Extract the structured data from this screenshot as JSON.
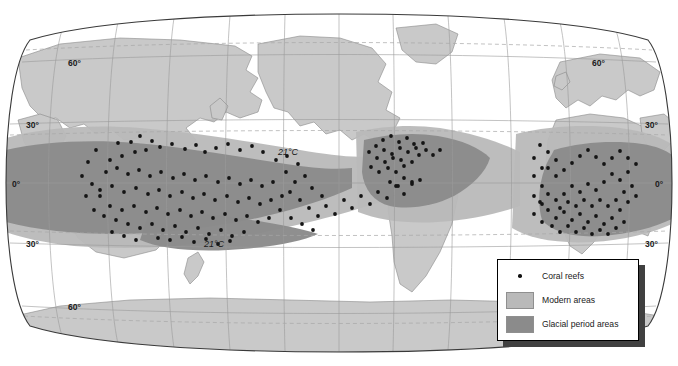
{
  "figure": {
    "kind": "world-map",
    "projection": "robinson-like",
    "title": "",
    "background_color": "#ffffff"
  },
  "colors": {
    "ocean": "#ffffff",
    "land": "#c9c9c9",
    "land_outline": "#8a8a8a",
    "modern_areas": "#b9b9b9",
    "glacial_period_areas": "#8b8b8b",
    "graticule": "#9a9a9a",
    "tropic_dashed": "#a8a8a8",
    "map_border": "#3a3a3a",
    "reef_dot": "#141414",
    "legend_border": "#000000",
    "legend_shadow": "#404040",
    "text": "#1a1a1a"
  },
  "graticule": {
    "latitude_lines": [
      60,
      30,
      0,
      -30,
      -60
    ],
    "longitude_step_deg": 30,
    "dashed_latitudes": [
      66.5,
      23.5,
      -23.5,
      -66.5
    ]
  },
  "latitude_labels": {
    "left": [
      {
        "text": "60°",
        "lat": 60
      },
      {
        "text": "30°",
        "lat": 30
      },
      {
        "text": "0°",
        "lat": 0
      },
      {
        "text": "30°",
        "lat": -30
      },
      {
        "text": "60°",
        "lat": -60
      }
    ],
    "right": [
      {
        "text": "60°",
        "lat": 60
      },
      {
        "text": "30°",
        "lat": 30
      },
      {
        "text": "0°",
        "lat": 0
      },
      {
        "text": "30°",
        "lat": -30
      }
    ]
  },
  "isotherms": [
    {
      "label": "21°C",
      "hemisphere": "north",
      "x": 296,
      "y": 151
    },
    {
      "label": "21°C",
      "hemisphere": "south",
      "x": 222,
      "y": 243
    }
  ],
  "legend": {
    "items": [
      {
        "key": "point",
        "label": "Coral reefs",
        "color": "#141414"
      },
      {
        "key": "swatch",
        "label": "Modern areas",
        "color": "#b9b9b9"
      },
      {
        "key": "swatch",
        "label": "Glacial period areas",
        "color": "#8b8b8b"
      }
    ]
  },
  "chart_data": {
    "type": "map",
    "xlabel": "Longitude",
    "ylabel": "Latitude",
    "xlim": [
      -180,
      180
    ],
    "ylim": [
      -90,
      90
    ],
    "grid": true,
    "legend_position": "bottom-right",
    "series": [
      {
        "name": "Coral reefs",
        "kind": "points",
        "color": "#141414"
      },
      {
        "name": "Modern areas",
        "kind": "region",
        "color": "#b9b9b9"
      },
      {
        "name": "Glacial period areas",
        "kind": "region",
        "color": "#8b8b8b"
      }
    ],
    "annotations": [
      "21°C",
      "21°C"
    ],
    "reef_points": [
      [
        118,
        143
      ],
      [
        131,
        142
      ],
      [
        140,
        136
      ],
      [
        152,
        141
      ],
      [
        110,
        160
      ],
      [
        122,
        156
      ],
      [
        135,
        152
      ],
      [
        146,
        150
      ],
      [
        160,
        147
      ],
      [
        172,
        144
      ],
      [
        185,
        149
      ],
      [
        196,
        145
      ],
      [
        205,
        152
      ],
      [
        216,
        148
      ],
      [
        228,
        144
      ],
      [
        240,
        150
      ],
      [
        252,
        146
      ],
      [
        263,
        152
      ],
      [
        106,
        172
      ],
      [
        117,
        168
      ],
      [
        128,
        174
      ],
      [
        139,
        170
      ],
      [
        150,
        176
      ],
      [
        161,
        172
      ],
      [
        173,
        178
      ],
      [
        184,
        174
      ],
      [
        195,
        180
      ],
      [
        206,
        176
      ],
      [
        218,
        182
      ],
      [
        229,
        178
      ],
      [
        240,
        184
      ],
      [
        251,
        180
      ],
      [
        262,
        186
      ],
      [
        273,
        182
      ],
      [
        100,
        190
      ],
      [
        112,
        186
      ],
      [
        124,
        192
      ],
      [
        136,
        188
      ],
      [
        148,
        194
      ],
      [
        159,
        190
      ],
      [
        170,
        196
      ],
      [
        182,
        192
      ],
      [
        193,
        198
      ],
      [
        204,
        194
      ],
      [
        215,
        200
      ],
      [
        227,
        196
      ],
      [
        238,
        202
      ],
      [
        249,
        198
      ],
      [
        260,
        204
      ],
      [
        271,
        200
      ],
      [
        282,
        196
      ],
      [
        110,
        206
      ],
      [
        122,
        210
      ],
      [
        134,
        206
      ],
      [
        146,
        212
      ],
      [
        157,
        208
      ],
      [
        168,
        214
      ],
      [
        180,
        210
      ],
      [
        191,
        216
      ],
      [
        202,
        212
      ],
      [
        213,
        218
      ],
      [
        225,
        214
      ],
      [
        236,
        220
      ],
      [
        247,
        216
      ],
      [
        258,
        222
      ],
      [
        269,
        218
      ],
      [
        128,
        224
      ],
      [
        140,
        228
      ],
      [
        152,
        224
      ],
      [
        163,
        230
      ],
      [
        175,
        226
      ],
      [
        186,
        232
      ],
      [
        198,
        228
      ],
      [
        209,
        234
      ],
      [
        221,
        230
      ],
      [
        232,
        236
      ],
      [
        244,
        232
      ],
      [
        158,
        238
      ],
      [
        170,
        240
      ],
      [
        182,
        237
      ],
      [
        194,
        242
      ],
      [
        206,
        239
      ],
      [
        218,
        244
      ],
      [
        230,
        241
      ],
      [
        96,
        150
      ],
      [
        88,
        162
      ],
      [
        82,
        176
      ],
      [
        92,
        184
      ],
      [
        100,
        196
      ],
      [
        86,
        196
      ],
      [
        94,
        210
      ],
      [
        104,
        216
      ],
      [
        116,
        220
      ],
      [
        112,
        232
      ],
      [
        124,
        236
      ],
      [
        136,
        240
      ],
      [
        276,
        160
      ],
      [
        287,
        156
      ],
      [
        298,
        164
      ],
      [
        286,
        172
      ],
      [
        295,
        182
      ],
      [
        305,
        176
      ],
      [
        290,
        192
      ],
      [
        300,
        200
      ],
      [
        312,
        188
      ],
      [
        322,
        196
      ],
      [
        309,
        208
      ],
      [
        318,
        216
      ],
      [
        280,
        210
      ],
      [
        291,
        218
      ],
      [
        302,
        224
      ],
      [
        313,
        230
      ],
      [
        326,
        206
      ],
      [
        335,
        214
      ],
      [
        344,
        200
      ],
      [
        352,
        208
      ],
      [
        361,
        196
      ],
      [
        370,
        204
      ],
      [
        378,
        192
      ],
      [
        387,
        198
      ],
      [
        396,
        186
      ],
      [
        404,
        194
      ],
      [
        412,
        182
      ],
      [
        383,
        140
      ],
      [
        391,
        136
      ],
      [
        399,
        142
      ],
      [
        407,
        138
      ],
      [
        414,
        144
      ],
      [
        376,
        146
      ],
      [
        384,
        150
      ],
      [
        392,
        154
      ],
      [
        400,
        148
      ],
      [
        408,
        152
      ],
      [
        416,
        148
      ],
      [
        423,
        143
      ],
      [
        369,
        152
      ],
      [
        377,
        158
      ],
      [
        385,
        162
      ],
      [
        393,
        158
      ],
      [
        401,
        160
      ],
      [
        388,
        168
      ],
      [
        396,
        172
      ],
      [
        404,
        166
      ],
      [
        412,
        162
      ],
      [
        371,
        167
      ],
      [
        379,
        172
      ],
      [
        419,
        155
      ],
      [
        426,
        150
      ],
      [
        433,
        155
      ],
      [
        440,
        150
      ],
      [
        404,
        178
      ],
      [
        412,
        184
      ],
      [
        420,
        180
      ],
      [
        398,
        186
      ],
      [
        390,
        182
      ],
      [
        540,
        145
      ],
      [
        548,
        152
      ],
      [
        556,
        160
      ],
      [
        548,
        168
      ],
      [
        556,
        176
      ],
      [
        564,
        170
      ],
      [
        572,
        163
      ],
      [
        580,
        156
      ],
      [
        588,
        150
      ],
      [
        596,
        157
      ],
      [
        604,
        164
      ],
      [
        612,
        158
      ],
      [
        620,
        151
      ],
      [
        628,
        158
      ],
      [
        636,
        164
      ],
      [
        628,
        172
      ],
      [
        620,
        180
      ],
      [
        612,
        174
      ],
      [
        604,
        182
      ],
      [
        596,
        190
      ],
      [
        588,
        184
      ],
      [
        580,
        192
      ],
      [
        572,
        186
      ],
      [
        564,
        194
      ],
      [
        556,
        200
      ],
      [
        548,
        194
      ],
      [
        540,
        202
      ],
      [
        548,
        210
      ],
      [
        556,
        218
      ],
      [
        564,
        212
      ],
      [
        572,
        220
      ],
      [
        580,
        214
      ],
      [
        588,
        222
      ],
      [
        596,
        216
      ],
      [
        604,
        224
      ],
      [
        612,
        218
      ],
      [
        620,
        210
      ],
      [
        628,
        202
      ],
      [
        636,
        196
      ],
      [
        632,
        186
      ],
      [
        624,
        192
      ],
      [
        616,
        200
      ],
      [
        608,
        206
      ],
      [
        600,
        200
      ],
      [
        592,
        206
      ],
      [
        584,
        200
      ],
      [
        576,
        206
      ],
      [
        568,
        202
      ],
      [
        560,
        208
      ],
      [
        552,
        226
      ],
      [
        560,
        232
      ],
      [
        568,
        226
      ],
      [
        576,
        232
      ],
      [
        584,
        228
      ],
      [
        592,
        234
      ],
      [
        600,
        230
      ],
      [
        608,
        234
      ],
      [
        616,
        228
      ],
      [
        624,
        222
      ],
      [
        534,
        158
      ],
      [
        534,
        176
      ],
      [
        534,
        196
      ],
      [
        534,
        214
      ],
      [
        542,
        186
      ],
      [
        542,
        168
      ],
      [
        542,
        204
      ],
      [
        542,
        222
      ]
    ]
  }
}
